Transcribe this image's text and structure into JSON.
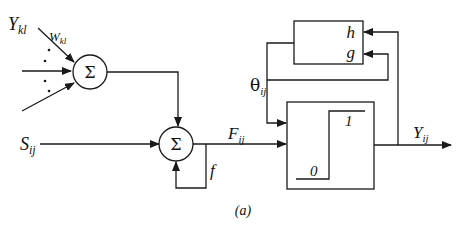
{
  "figure": {
    "caption": "(a)",
    "inputs": {
      "feeding_input": {
        "main": "Y",
        "sub": "kl"
      },
      "weight": {
        "main": "W",
        "sub": "kl"
      },
      "stimulus": {
        "main": "S",
        "sub": "ij"
      }
    },
    "summation_symbol": "Σ",
    "signals": {
      "feeding": {
        "main": "F",
        "sub": "ij"
      },
      "threshold": {
        "main": "θ",
        "sub": "ij"
      },
      "output": {
        "main": "Y",
        "sub": "ij"
      },
      "feedback": "f"
    },
    "threshold_block": {
      "inputs": [
        "h",
        "g"
      ]
    },
    "step_block": {
      "low": "0",
      "high": "1"
    }
  }
}
